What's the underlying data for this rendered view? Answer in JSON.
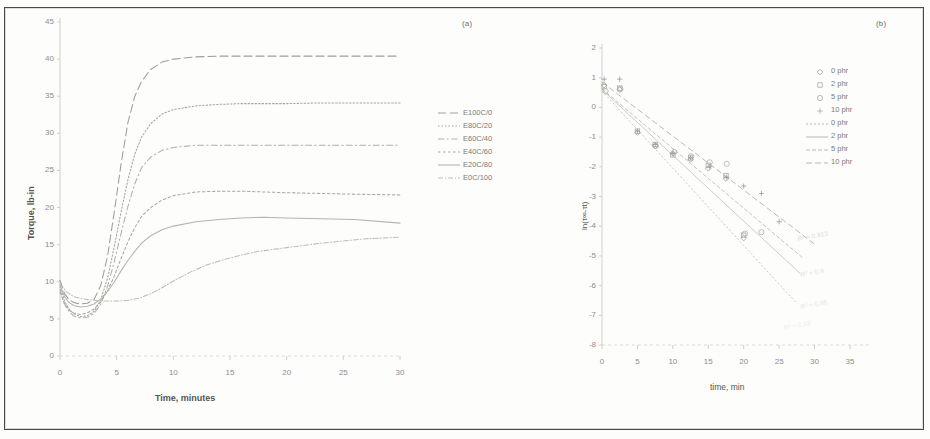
{
  "figure": {
    "panel_a_tag": "(a)",
    "panel_b_tag": "(b)"
  },
  "chart_data": [
    {
      "id": "panel-a",
      "type": "line",
      "title": "(a)",
      "xlabel": "Time, minutes",
      "ylabel": "Torque, lb-in",
      "xlim": [
        0,
        30
      ],
      "ylim": [
        0,
        45
      ],
      "xticks": [
        0,
        5,
        10,
        15,
        20,
        25,
        30
      ],
      "yticks": [
        0,
        5,
        10,
        15,
        20,
        25,
        30,
        35,
        40,
        45
      ],
      "grid": false,
      "legend_position": "right",
      "series": [
        {
          "name": "E100C/0",
          "dash": "8 4",
          "color": "#9d9d98",
          "x": [
            0,
            0.4,
            0.8,
            1.2,
            1.8,
            2.4,
            3.0,
            3.6,
            4.2,
            4.8,
            5.4,
            6.0,
            6.6,
            7.2,
            8.0,
            9.0,
            10.0,
            12.0,
            14.0,
            16.0,
            18.0,
            20.0,
            23.0,
            26.0,
            30.0
          ],
          "y": [
            10.2,
            8.4,
            7.6,
            7.2,
            7.0,
            7.1,
            7.6,
            9.5,
            13.5,
            19.5,
            26.0,
            31.5,
            35.0,
            37.0,
            38.6,
            39.6,
            40.0,
            40.3,
            40.4,
            40.4,
            40.4,
            40.4,
            40.4,
            40.4,
            40.4
          ]
        },
        {
          "name": "E80C/20",
          "dash": "1.5 2",
          "color": "#a5a5a0",
          "x": [
            0,
            0.4,
            0.8,
            1.2,
            1.8,
            2.4,
            3.0,
            3.6,
            4.2,
            4.8,
            5.4,
            6.0,
            6.6,
            7.2,
            8.0,
            9.0,
            10.0,
            12.0,
            14.0,
            16.0,
            18.0,
            20.0,
            23.0,
            26.0,
            30.0
          ],
          "y": [
            9.4,
            7.4,
            6.3,
            5.7,
            5.3,
            5.4,
            6.0,
            7.6,
            10.5,
            14.8,
            19.5,
            23.8,
            27.2,
            29.5,
            31.3,
            32.6,
            33.2,
            33.7,
            33.9,
            34.0,
            34.0,
            34.0,
            34.1,
            34.1,
            34.1
          ]
        },
        {
          "name": "E60C/40",
          "dash": "6 3 1.5 3",
          "color": "#b0b0ab",
          "x": [
            0,
            0.4,
            0.8,
            1.2,
            1.8,
            2.4,
            3.0,
            3.6,
            4.2,
            4.8,
            5.4,
            6.0,
            6.6,
            7.2,
            8.0,
            9.0,
            10.0,
            12.0,
            14.0,
            16.0,
            18.0,
            20.0,
            23.0,
            26.0,
            30.0
          ],
          "y": [
            9.0,
            7.0,
            6.0,
            5.4,
            5.1,
            5.2,
            5.7,
            7.0,
            9.4,
            12.8,
            16.6,
            20.2,
            23.2,
            25.4,
            26.8,
            27.7,
            28.1,
            28.4,
            28.4,
            28.4,
            28.4,
            28.4,
            28.4,
            28.4,
            28.4
          ]
        },
        {
          "name": "E40C/60",
          "dash": "2.5 2.5",
          "color": "#a9a9a4",
          "x": [
            0,
            0.4,
            0.8,
            1.2,
            1.8,
            2.4,
            3.0,
            3.6,
            4.2,
            4.8,
            5.4,
            6.0,
            6.6,
            7.2,
            8.0,
            9.0,
            10.0,
            12.0,
            14.0,
            16.0,
            18.0,
            20.0,
            23.0,
            26.0,
            30.0
          ],
          "y": [
            8.6,
            7.0,
            6.2,
            5.8,
            5.6,
            5.8,
            6.3,
            7.3,
            8.8,
            10.8,
            13.2,
            15.4,
            17.3,
            18.8,
            20.0,
            21.0,
            21.6,
            22.1,
            22.2,
            22.2,
            22.1,
            22.0,
            21.9,
            21.8,
            21.7
          ]
        },
        {
          "name": "E20C/80",
          "dash": "0",
          "color": "#b4b4af",
          "x": [
            0,
            0.4,
            0.8,
            1.2,
            1.8,
            2.4,
            3.0,
            3.6,
            4.2,
            4.8,
            5.4,
            6.0,
            6.6,
            7.2,
            8.0,
            9.0,
            10.0,
            12.0,
            14.0,
            16.0,
            18.0,
            20.0,
            23.0,
            26.0,
            30.0
          ],
          "y": [
            9.6,
            8.0,
            7.2,
            6.8,
            6.6,
            6.7,
            7.0,
            7.7,
            8.7,
            10.0,
            11.5,
            12.9,
            14.1,
            15.2,
            16.2,
            17.0,
            17.5,
            18.1,
            18.4,
            18.6,
            18.7,
            18.6,
            18.5,
            18.4,
            17.9
          ]
        },
        {
          "name": "E0C/100",
          "dash": "5 2 1 2",
          "color": "#bdbdb8",
          "x": [
            0,
            0.6,
            1.2,
            2.0,
            3.0,
            4.0,
            5.0,
            6.0,
            7.0,
            8.0,
            9.0,
            10.0,
            11.5,
            13.0,
            14.5,
            16.0,
            17.5,
            19.0,
            21.0,
            23.0,
            25.0,
            27.0,
            30.0
          ],
          "y": [
            9.8,
            8.6,
            8.0,
            7.7,
            7.5,
            7.4,
            7.4,
            7.5,
            7.8,
            8.4,
            9.2,
            10.1,
            11.3,
            12.3,
            13.0,
            13.6,
            14.1,
            14.4,
            14.8,
            15.2,
            15.5,
            15.8,
            16.0
          ]
        }
      ]
    },
    {
      "id": "panel-b",
      "type": "scatter",
      "title": "(b)",
      "xlabel": "time, min",
      "ylabel": "ln(τ∞-τt)",
      "xlim": [
        0,
        35
      ],
      "ylim": [
        -8,
        2
      ],
      "xticks": [
        0,
        5,
        10,
        15,
        20,
        25,
        30,
        35
      ],
      "yticks": [
        2,
        1,
        0,
        -1,
        -2,
        -3,
        -4,
        -5,
        -6,
        -7,
        -8
      ],
      "grid": false,
      "legend_position": "upper-right",
      "annotations": [
        {
          "text": "R² = 0.913",
          "x": 27.5,
          "y": -4.3
        },
        {
          "text": "R² = 0.9",
          "x": 28.0,
          "y": -5.5
        },
        {
          "text": "R² = 0.95",
          "x": 28.0,
          "y": -6.6
        },
        {
          "text": "R² = 0.93",
          "x": 25.5,
          "y": -7.3
        }
      ],
      "series": [
        {
          "name": "0 phr",
          "kind": "markers",
          "marker": "diamond",
          "color": "#a0a09b",
          "x": [
            0.3,
            2.5,
            5.0,
            7.5,
            10.0,
            12.5,
            15.0,
            17.5,
            20.0
          ],
          "y": [
            0.75,
            0.6,
            -0.85,
            -1.3,
            -1.55,
            -1.75,
            -2.05,
            -2.4,
            -4.4
          ]
        },
        {
          "name": "2 phr",
          "kind": "markers",
          "marker": "square",
          "color": "#a8a8a3",
          "x": [
            0.3,
            2.5,
            5.0,
            7.5,
            10.0,
            12.5,
            15.0,
            17.5,
            20.0
          ],
          "y": [
            0.7,
            0.65,
            -0.8,
            -1.25,
            -1.6,
            -1.7,
            -1.95,
            -2.3,
            -4.3
          ]
        },
        {
          "name": "5 phr",
          "kind": "markers",
          "marker": "circle",
          "color": "#aeaea9",
          "x": [
            0.5,
            2.6,
            7.6,
            10.2,
            12.6,
            15.2,
            17.6,
            20.2,
            22.5
          ],
          "y": [
            0.55,
            0.62,
            -1.3,
            -1.5,
            -1.65,
            -1.85,
            -1.9,
            -4.25,
            -4.2
          ]
        },
        {
          "name": "10 phr",
          "kind": "markers",
          "marker": "plus",
          "color": "#9c9c97",
          "x": [
            0.3,
            2.5,
            5.0,
            7.5,
            10.0,
            12.5,
            15.2,
            17.6,
            20.0,
            22.5,
            25.0
          ],
          "y": [
            0.95,
            0.95,
            -0.8,
            -1.25,
            -1.55,
            -1.7,
            -2.0,
            -2.35,
            -2.65,
            -2.9,
            -3.85
          ]
        },
        {
          "name": "0 phr",
          "kind": "line",
          "dash": "2 2",
          "color": "#c2c2bd",
          "x": [
            0.0,
            27.5
          ],
          "y": [
            0.55,
            -6.6
          ]
        },
        {
          "name": "2 phr",
          "kind": "line",
          "dash": "0",
          "color": "#c6c6c1",
          "x": [
            0.0,
            28.0
          ],
          "y": [
            0.6,
            -5.6
          ]
        },
        {
          "name": "5 phr",
          "kind": "line",
          "dash": "4 2",
          "color": "#bcbcb7",
          "x": [
            0.0,
            28.5
          ],
          "y": [
            0.62,
            -5.1
          ]
        },
        {
          "name": "10 phr",
          "kind": "line",
          "dash": "6 3",
          "color": "#b2b2ad",
          "x": [
            0.0,
            30.0
          ],
          "y": [
            0.85,
            -4.6
          ]
        }
      ]
    }
  ],
  "panel_a": {
    "tag": "(a)",
    "ylabel": "Torque, lb-in",
    "xlabel": "Time, minutes",
    "yticks": [
      "45",
      "40",
      "35",
      "30",
      "25",
      "20",
      "15",
      "10",
      "5",
      "0"
    ],
    "xticks": [
      "0",
      "5",
      "10",
      "15",
      "20",
      "25",
      "30"
    ],
    "legend": [
      {
        "label": "E100C/0"
      },
      {
        "label": "E80C/20"
      },
      {
        "label": "E60C/40"
      },
      {
        "label": "E40C/60"
      },
      {
        "label": "E20C/80"
      },
      {
        "label": "E0C/100"
      }
    ]
  },
  "panel_b": {
    "tag": "(b)",
    "ylabel": "ln(τ∞-τt)",
    "xlabel": "time, min",
    "yticks": [
      "2",
      "1",
      "0",
      "-1",
      "-2",
      "-3",
      "-4",
      "-5",
      "-6",
      "-7",
      "-8"
    ],
    "xticks": [
      "0",
      "5",
      "10",
      "15",
      "20",
      "25",
      "30",
      "35"
    ],
    "legend": [
      {
        "label": "0 phr",
        "kind": "marker",
        "marker": "diamond"
      },
      {
        "label": "2 phr",
        "kind": "marker",
        "marker": "square"
      },
      {
        "label": "5 phr",
        "kind": "marker",
        "marker": "circle"
      },
      {
        "label": "10 phr",
        "kind": "marker",
        "marker": "plus"
      },
      {
        "label": "0 phr",
        "kind": "line",
        "dash": "2 2"
      },
      {
        "label": "2 phr",
        "kind": "line",
        "dash": "0"
      },
      {
        "label": "5 phr",
        "kind": "line",
        "dash": "4 2"
      },
      {
        "label": "10 phr",
        "kind": "line",
        "dash": "6 3"
      }
    ],
    "annotations": [
      "R² = 0.913",
      "R² = 0.9",
      "R² = 0.95",
      "R² = 0.93"
    ]
  }
}
